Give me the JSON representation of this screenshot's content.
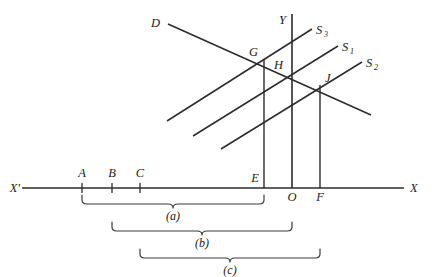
{
  "figure": {
    "kind": "supply-demand-diagram",
    "axes": {
      "x_right_label": "X",
      "x_left_label": "X'",
      "y_label": "Y",
      "origin_label": "O"
    },
    "curves": [
      {
        "id": "demand",
        "label": "D",
        "label_sub": ""
      },
      {
        "id": "supply3",
        "label": "S",
        "label_sub": "3"
      },
      {
        "id": "supply1",
        "label": "S",
        "label_sub": "1"
      },
      {
        "id": "supply2",
        "label": "S",
        "label_sub": "2"
      }
    ],
    "intersection_points": [
      {
        "label": "G"
      },
      {
        "label": "H"
      },
      {
        "label": "J"
      }
    ],
    "axis_points": [
      {
        "label": "A"
      },
      {
        "label": "B"
      },
      {
        "label": "C"
      },
      {
        "label": "E"
      },
      {
        "label": "O"
      },
      {
        "label": "F"
      }
    ],
    "braces": [
      {
        "label": "(a)"
      },
      {
        "label": "(b)"
      },
      {
        "label": "(c)"
      }
    ],
    "colors": {
      "ink": "#2b2b2b",
      "brace": "#3a3a3a",
      "background": "#ffffff"
    }
  }
}
